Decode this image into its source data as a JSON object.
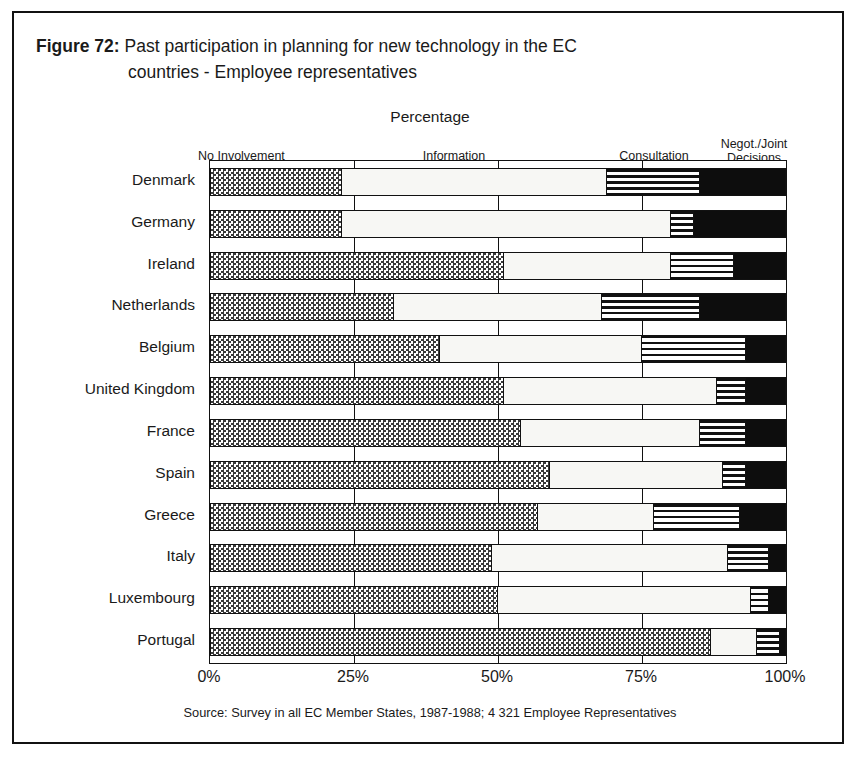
{
  "figure": {
    "number_label": "Figure 72:",
    "title_line_1": "Past participation in planning for new technology in the EC",
    "title_line_2": "countries - Employee representatives",
    "axis_caption": "Percentage",
    "source_note": "Source: Survey in all EC Member States, 1987-1988; 4 321 Employee Representatives"
  },
  "legend": {
    "no_involvement": "No Involvement",
    "information": "Information",
    "consultation": "Consultation",
    "negot_joint_decisions": "Negot./Joint\nDecisions"
  },
  "colors": {
    "no_involvement": "#b4b4b4",
    "information": "#f7f7f4",
    "consultation": "#6e6e6e",
    "negot_joint_decisions": "#0d0d0d",
    "axis": "#111111",
    "frame": "#111111",
    "text": "#1a1a1a"
  },
  "chart_data": {
    "type": "bar",
    "orientation": "horizontal",
    "stacked": true,
    "normalized": true,
    "title": "Figure 72: Past participation in planning for new technology in the EC countries - Employee representatives",
    "subtitle": "Percentage",
    "xlabel": "Percentage",
    "ylabel": "",
    "xlim": [
      0,
      100
    ],
    "xticks": [
      0,
      25,
      50,
      75,
      100
    ],
    "xtick_labels": [
      "0%",
      "25%",
      "50%",
      "75%",
      "100%"
    ],
    "grid": true,
    "legend_position": "top",
    "categories": [
      "Denmark",
      "Germany",
      "Ireland",
      "Netherlands",
      "Belgium",
      "United Kingdom",
      "France",
      "Spain",
      "Greece",
      "Italy",
      "Luxembourg",
      "Portugal"
    ],
    "series": [
      {
        "name": "No Involvement",
        "values": [
          23,
          23,
          51,
          32,
          40,
          51,
          54,
          59,
          57,
          49,
          50,
          87
        ]
      },
      {
        "name": "Information",
        "values": [
          46,
          57,
          29,
          36,
          35,
          37,
          31,
          30,
          20,
          41,
          44,
          8
        ]
      },
      {
        "name": "Consultation",
        "values": [
          16,
          4,
          11,
          17,
          18,
          5,
          8,
          4,
          15,
          7,
          3,
          4
        ]
      },
      {
        "name": "Negot./Joint Decisions",
        "values": [
          15,
          16,
          9,
          15,
          7,
          7,
          7,
          7,
          8,
          3,
          3,
          1
        ]
      }
    ]
  }
}
